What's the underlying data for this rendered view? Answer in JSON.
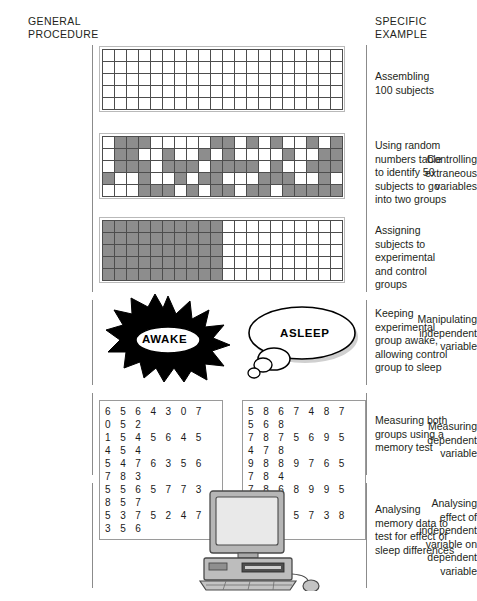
{
  "headers": {
    "general": "GENERAL\nPROCEDURE",
    "specific": "SPECIFIC\nEXAMPLE"
  },
  "stages": [
    {
      "id": "sampling",
      "left_label": "",
      "right_label": "Assembling\n100 subjects"
    },
    {
      "id": "controlling",
      "left_label": "Controlling\nextraneous\nvariables",
      "right_label": "Using random\nnumbers table\nto identify 50\nsubjects to go\ninto two groups"
    },
    {
      "id": "assigning",
      "left_label": "",
      "right_label": "Assigning\nsubjects to\nexperimental\nand control\ngroups"
    },
    {
      "id": "manipulating",
      "left_label": "Manipulating\nindependent\nvariable",
      "right_label": "Keeping\nexperimental\ngroup awake,\nallowing control\ngroup to sleep"
    },
    {
      "id": "measuring",
      "left_label": "Measuring\ndependent\nvariable",
      "right_label": "Measuring both\ngroups using a\nmemory test"
    },
    {
      "id": "analysing",
      "left_label": "Analysing\neffect of\nindependent\nvariable on\ndependent\nvariable",
      "right_label": "Analysing\nmemory data to\ntest for effect of\nsleep differences"
    }
  ],
  "grids": {
    "columns": 20,
    "rows": 5,
    "empty": [
      [
        0,
        0,
        0,
        0,
        0,
        0,
        0,
        0,
        0,
        0,
        0,
        0,
        0,
        0,
        0,
        0,
        0,
        0,
        0,
        0
      ],
      [
        0,
        0,
        0,
        0,
        0,
        0,
        0,
        0,
        0,
        0,
        0,
        0,
        0,
        0,
        0,
        0,
        0,
        0,
        0,
        0
      ],
      [
        0,
        0,
        0,
        0,
        0,
        0,
        0,
        0,
        0,
        0,
        0,
        0,
        0,
        0,
        0,
        0,
        0,
        0,
        0,
        0
      ],
      [
        0,
        0,
        0,
        0,
        0,
        0,
        0,
        0,
        0,
        0,
        0,
        0,
        0,
        0,
        0,
        0,
        0,
        0,
        0,
        0
      ],
      [
        0,
        0,
        0,
        0,
        0,
        0,
        0,
        0,
        0,
        0,
        0,
        0,
        0,
        0,
        0,
        0,
        0,
        0,
        0,
        0
      ]
    ],
    "random": [
      [
        0,
        1,
        1,
        1,
        0,
        0,
        0,
        0,
        0,
        1,
        1,
        0,
        1,
        0,
        1,
        0,
        0,
        1,
        0,
        1
      ],
      [
        0,
        1,
        1,
        0,
        0,
        1,
        0,
        0,
        1,
        0,
        1,
        0,
        0,
        0,
        0,
        1,
        0,
        0,
        1,
        1
      ],
      [
        0,
        1,
        1,
        1,
        0,
        1,
        1,
        1,
        0,
        1,
        1,
        1,
        1,
        0,
        1,
        0,
        0,
        1,
        1,
        1
      ],
      [
        1,
        0,
        0,
        1,
        0,
        0,
        1,
        0,
        1,
        1,
        0,
        0,
        0,
        1,
        1,
        1,
        0,
        0,
        1,
        0
      ],
      [
        0,
        0,
        0,
        1,
        1,
        1,
        0,
        1,
        0,
        1,
        1,
        0,
        1,
        1,
        0,
        1,
        1,
        1,
        1,
        1
      ]
    ],
    "split": [
      [
        1,
        1,
        1,
        1,
        1,
        1,
        1,
        1,
        1,
        1,
        0,
        0,
        0,
        0,
        0,
        0,
        0,
        0,
        0,
        0
      ],
      [
        1,
        1,
        1,
        1,
        1,
        1,
        1,
        1,
        1,
        1,
        0,
        0,
        0,
        0,
        0,
        0,
        0,
        0,
        0,
        0
      ],
      [
        1,
        1,
        1,
        1,
        1,
        1,
        1,
        1,
        1,
        1,
        0,
        0,
        0,
        0,
        0,
        0,
        0,
        0,
        0,
        0
      ],
      [
        1,
        1,
        1,
        1,
        1,
        1,
        1,
        1,
        1,
        1,
        0,
        0,
        0,
        0,
        0,
        0,
        0,
        0,
        0,
        0
      ],
      [
        1,
        1,
        1,
        1,
        1,
        1,
        1,
        1,
        1,
        1,
        0,
        0,
        0,
        0,
        0,
        0,
        0,
        0,
        0,
        0
      ]
    ]
  },
  "illustration": {
    "awake_label": "AWAKE",
    "asleep_label": "ASLEEP",
    "computer_name": "desktop-computer"
  },
  "data_panels": {
    "experimental": "6 5 6 4 3 0 7 0 5 2\n1 5 4 5 6 4 5 4 5 4\n5 4 7 6 3 5 6 7 8 3\n5 5 6 5 7 7 3 8 5 7\n5 3 7 5 2 4 7 3 5 6",
    "control": "5 8 6 7 4 8 7 5 6 8\n7 8 7 5 6 9 5 4 7 8\n9 8 8 9 7 6 5 7 8 4\n7 8 6 8 9 9 5 8 7 5\n7 8 7 5 7 3 8 1 9 9"
  },
  "colors": {
    "ink": "#231f20",
    "cell_border": "#4d4d4d",
    "cell_fill": "#8d8d8d",
    "rule": "#8b8b8b"
  }
}
